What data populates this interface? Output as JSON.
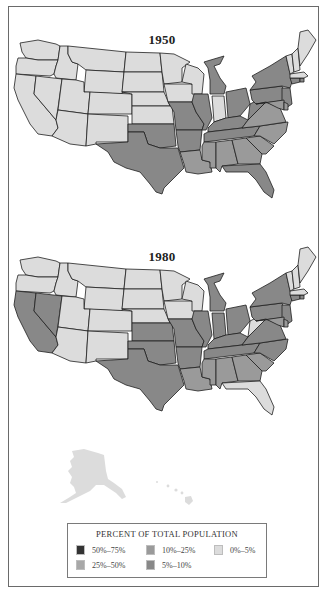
{
  "maps": [
    {
      "title": "1950",
      "states": {
        "WA": "c0",
        "OR": "c0",
        "CA": "c0",
        "ID": "c0",
        "NV": "c0",
        "MT": "c0",
        "WY": "c0",
        "UT": "c0",
        "AZ": "c0",
        "CO": "c0",
        "NM": "c0",
        "ND": "c0",
        "SD": "c0",
        "NE": "c0",
        "KS": "c0",
        "MN": "c0",
        "IA": "c0",
        "WI": "c0",
        "IN": "c0",
        "ME": "c0",
        "VT": "c0",
        "NH": "c0",
        "MA": "c0",
        "TX": "c5",
        "OK": "c5",
        "MO": "c5",
        "AR": "c5",
        "IL": "c5",
        "MI": "c5",
        "OH": "c5",
        "KY": "c5",
        "TN": "c5",
        "WV": "c5",
        "PA": "c5",
        "NY": "c5",
        "NJ": "c5",
        "CT": "c5",
        "RI": "c5",
        "LA": "c10",
        "MS": "c10",
        "AL": "c10",
        "GA": "c10",
        "SC": "c10",
        "NC": "c10",
        "VA": "c10",
        "MD": "c10",
        "DE": "c10",
        "FL": "c5"
      }
    },
    {
      "title": "1980",
      "states": {
        "WA": "c0",
        "OR": "c0",
        "ID": "c0",
        "MT": "c0",
        "WY": "c0",
        "UT": "c0",
        "AZ": "c0",
        "CO": "c0",
        "NM": "c0",
        "ND": "c0",
        "SD": "c0",
        "NE": "c0",
        "MN": "c0",
        "IA": "c0",
        "WI": "c0",
        "ME": "c0",
        "VT": "c0",
        "NH": "c0",
        "MA": "c0",
        "WV": "c0",
        "FL": "c0",
        "CA": "c5",
        "NV": "c5",
        "KS": "c5",
        "TX": "c5",
        "OK": "c5",
        "MO": "c5",
        "AR": "c5",
        "IL": "c5",
        "IN": "c5",
        "MI": "c5",
        "OH": "c5",
        "KY": "c5",
        "TN": "c5",
        "PA": "c5",
        "NY": "c5",
        "NJ": "c5",
        "CT": "c5",
        "RI": "c5",
        "VA": "c5",
        "NC": "c5",
        "LA": "c10",
        "MS": "c10",
        "AL": "c10",
        "GA": "c10",
        "SC": "c10",
        "MD": "c10",
        "DE": "c10",
        "AK": "c0",
        "HI": "c0"
      }
    }
  ],
  "legend": {
    "title": "PERCENT OF TOTAL POPULATION",
    "items": [
      {
        "key": "c50",
        "label": "50%–75%",
        "color": "#333333"
      },
      {
        "key": "c10",
        "label": "10%–25%",
        "color": "#9a9a9a"
      },
      {
        "key": "c0",
        "label": "0%–5%",
        "color": "#dcdcdc"
      },
      {
        "key": "c25",
        "label": "25%–50%",
        "color": "#a8a8a8"
      },
      {
        "key": "c5",
        "label": "5%–10%",
        "color": "#888888"
      }
    ]
  },
  "colors": {
    "c0": "#dcdcdc",
    "c5": "#888888",
    "c10": "#9a9a9a",
    "c25": "#a8a8a8",
    "c50": "#333333"
  }
}
